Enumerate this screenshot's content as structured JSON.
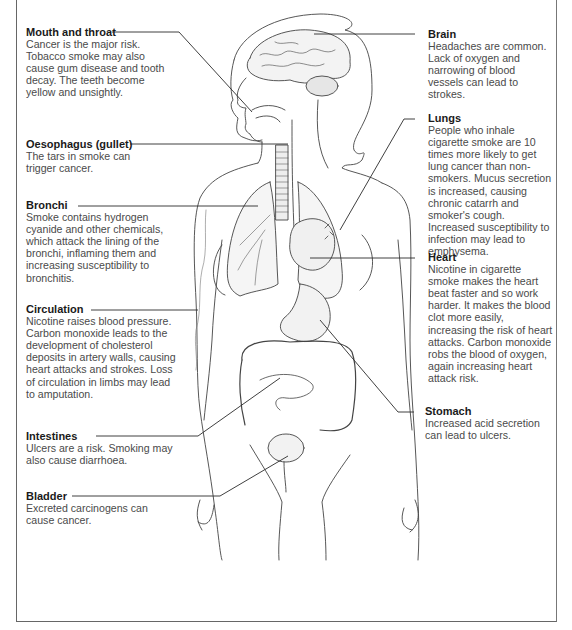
{
  "diagram": {
    "colors": {
      "text": "#4a4a4a",
      "heading": "#1a1a1a",
      "lines": "#333333",
      "frame": "#666666"
    }
  },
  "labels": [
    {
      "id": "mouth",
      "title": "Mouth and throat",
      "body": "Cancer is the major risk. Tobacco smoke may also cause gum disease and tooth decay. The teeth become yellow and unsightly."
    },
    {
      "id": "oesophagus",
      "title": "Oesophagus (gullet)",
      "body": "The tars in smoke can trigger cancer."
    },
    {
      "id": "bronchi",
      "title": "Bronchi",
      "body": "Smoke contains hydrogen cyanide and other chemicals, which attack the lining of the bronchi, inflaming them and increasing susceptibility to bronchitis."
    },
    {
      "id": "circulation",
      "title": "Circulation",
      "body": "Nicotine raises blood pressure. Carbon monoxide leads to the development of cholesterol deposits in artery walls, causing heart attacks and strokes. Loss of circulation in limbs may lead to amputation."
    },
    {
      "id": "intestines",
      "title": "Intestines",
      "body": "Ulcers are a risk. Smoking may also cause diarrhoea."
    },
    {
      "id": "bladder",
      "title": "Bladder",
      "body": "Excreted carcinogens can cause cancer."
    },
    {
      "id": "brain",
      "title": "Brain",
      "body": "Headaches are common. Lack of oxygen and narrowing of blood vessels can lead to strokes."
    },
    {
      "id": "lungs",
      "title": "Lungs",
      "body": "People who inhale cigarette smoke are 10 times more likely to get lung cancer than non-smokers. Mucus secretion is increased, causing chronic catarrh and smoker's cough. Increased susceptibility to infection may lead to emphysema."
    },
    {
      "id": "heart",
      "title": "Heart",
      "body": "Nicotine in cigarette smoke makes the heart beat faster and so work harder. It makes the blood clot more easily, increasing the risk of heart attacks. Carbon monoxide robs the blood of oxygen, again increasing heart attack risk."
    },
    {
      "id": "stomach",
      "title": "Stomach",
      "body": "Increased acid secretion can lead to ulcers."
    }
  ]
}
